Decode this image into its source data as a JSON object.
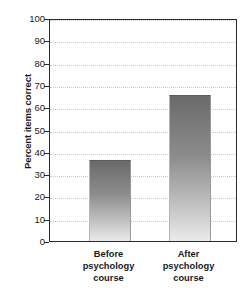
{
  "chart_data": {
    "type": "bar",
    "title": "",
    "xlabel": "",
    "ylabel": "Percent items correct",
    "ylim": [
      0,
      100
    ],
    "ytick_step": 10,
    "yticks": [
      100,
      90,
      80,
      70,
      60,
      50,
      40,
      30,
      20,
      10,
      0
    ],
    "grid": true,
    "legend": "none",
    "categories": [
      "Before psychology course",
      "After psychology course"
    ],
    "category_lines": [
      [
        "Before",
        "psychology",
        "course"
      ],
      [
        "After",
        "psychology",
        "course"
      ]
    ],
    "values": [
      36.5,
      65.5
    ],
    "bar_colors": {
      "gradient_top": "#6a6a6a",
      "gradient_bottom": "#ebebeb"
    },
    "axis_color": "#2b2b2b",
    "gridline_color": "#c9c9c9",
    "background": "#ffffff"
  }
}
